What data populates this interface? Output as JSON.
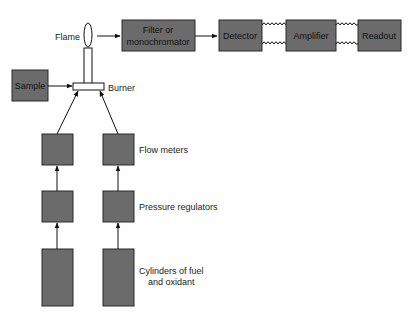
{
  "diagram": {
    "labels": {
      "flame": "Flame",
      "burner": "Burner",
      "flow_meters": "Flow meters",
      "pressure_regulators": "Pressure regulators",
      "cylinders_line1": "Cylinders of fuel",
      "cylinders_line2": "and oxidant"
    },
    "blocks": {
      "sample": "Sample",
      "filter_line1": "Filter or",
      "filter_line2": "monochromator",
      "detector": "Detector",
      "amplifier": "Amplifier",
      "readout": "Readout"
    },
    "connections": [
      {
        "from": "sample",
        "to": "burner",
        "type": "arrow"
      },
      {
        "from": "flame",
        "to": "filter",
        "type": "arrow"
      },
      {
        "from": "filter",
        "to": "detector",
        "type": "arrow"
      },
      {
        "from": "detector",
        "to": "amplifier",
        "type": "coil"
      },
      {
        "from": "amplifier",
        "to": "readout",
        "type": "coil"
      },
      {
        "from": "fuel-cylinder",
        "to": "fuel-pressure-regulator",
        "type": "arrow"
      },
      {
        "from": "oxidant-cylinder",
        "to": "oxidant-pressure-regulator",
        "type": "arrow"
      },
      {
        "from": "fuel-pressure-regulator",
        "to": "fuel-flow-meter",
        "type": "arrow"
      },
      {
        "from": "oxidant-pressure-regulator",
        "to": "oxidant-flow-meter",
        "type": "arrow"
      },
      {
        "from": "fuel-flow-meter",
        "to": "burner",
        "type": "arrow"
      },
      {
        "from": "oxidant-flow-meter",
        "to": "burner",
        "type": "arrow"
      }
    ],
    "colors": {
      "block_fill": "#6b6b6b",
      "line": "#111111",
      "background": "#ffffff"
    }
  }
}
